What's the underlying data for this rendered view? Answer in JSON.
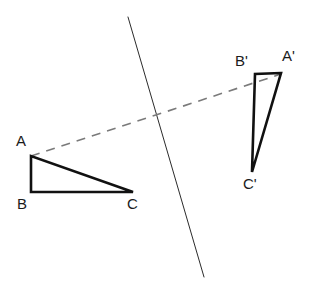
{
  "figure": {
    "canvas": {
      "width": 316,
      "height": 289,
      "background": "#ffffff"
    },
    "colors": {
      "shape_stroke": "#111111",
      "mirror_line_stroke": "#2b2b2b",
      "dashed_line_stroke": "#7a7a7a",
      "label_text": "#1b1b1b"
    },
    "strokes": {
      "triangle_width": 2.6,
      "mirror_line_width": 1.0,
      "dashed_line_width": 1.6,
      "dash_pattern": "9 7"
    }
  },
  "shapes": {
    "triangle_preimage": {
      "name": "ABC",
      "points": "31,156 31,192 133,192",
      "vertices": [
        {
          "label": "A",
          "x": 31,
          "y": 156
        },
        {
          "label": "B",
          "x": 31,
          "y": 192
        },
        {
          "label": "C",
          "x": 133,
          "y": 192
        }
      ]
    },
    "triangle_image": {
      "name": "A'B'C'",
      "points": "281,73 255,74 252,172",
      "vertices": [
        {
          "label": "A'",
          "x": 281,
          "y": 73
        },
        {
          "label": "B'",
          "x": 255,
          "y": 74
        },
        {
          "label": "C'",
          "x": 252,
          "y": 172
        }
      ]
    },
    "mirror_line": {
      "name": "line of reflection",
      "x1": 128,
      "y1": 17,
      "x2": 204,
      "y2": 277
    },
    "correspondence_line": {
      "name": "A to A' dashed connector",
      "x1": 31,
      "y1": 156,
      "x2": 281,
      "y2": 74
    }
  },
  "labels": {
    "a": {
      "text": "A",
      "left": 16,
      "top": 133
    },
    "b": {
      "text": "B",
      "left": 17,
      "top": 196
    },
    "c": {
      "text": "C",
      "left": 127,
      "top": 196
    },
    "a_prime": {
      "text": "A'",
      "left": 282,
      "top": 48
    },
    "b_prime": {
      "text": "B'",
      "left": 235,
      "top": 53
    },
    "c_prime": {
      "text": "C'",
      "left": 243,
      "top": 176
    }
  }
}
